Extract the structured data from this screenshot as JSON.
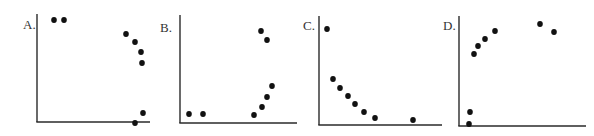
{
  "figure": {
    "width": 594,
    "height": 136,
    "axis_color": "#2a2a2a",
    "dot_color": "#111111",
    "dot_radius": 3
  },
  "chart_data": [
    {
      "type": "scatter",
      "title": "A.",
      "xlabel": "",
      "ylabel": "",
      "grid": false,
      "legend": null,
      "label_pos": {
        "x": 23,
        "y": 18
      },
      "axes": {
        "origin": {
          "x": 37,
          "y": 122
        },
        "y_top": 14,
        "x_right": 150
      },
      "points_px": [
        {
          "x": 54,
          "y": 20
        },
        {
          "x": 64,
          "y": 20
        },
        {
          "x": 126,
          "y": 34
        },
        {
          "x": 135,
          "y": 42
        },
        {
          "x": 141,
          "y": 52
        },
        {
          "x": 142,
          "y": 63
        },
        {
          "x": 143,
          "y": 113
        },
        {
          "x": 135,
          "y": 123
        }
      ],
      "points_normalized": [
        {
          "x": 0.15,
          "y": 0.95
        },
        {
          "x": 0.24,
          "y": 0.95
        },
        {
          "x": 0.79,
          "y": 0.81
        },
        {
          "x": 0.87,
          "y": 0.74
        },
        {
          "x": 0.92,
          "y": 0.65
        },
        {
          "x": 0.93,
          "y": 0.55
        },
        {
          "x": 0.94,
          "y": 0.08
        },
        {
          "x": 0.87,
          "y": 0.0
        }
      ]
    },
    {
      "type": "scatter",
      "title": "B.",
      "xlabel": "",
      "ylabel": "",
      "grid": false,
      "legend": null,
      "label_pos": {
        "x": 160,
        "y": 21
      },
      "axes": {
        "origin": {
          "x": 180,
          "y": 123
        },
        "y_top": 15,
        "x_right": 297
      },
      "points_px": [
        {
          "x": 189,
          "y": 114
        },
        {
          "x": 203,
          "y": 114
        },
        {
          "x": 261,
          "y": 31
        },
        {
          "x": 267,
          "y": 40
        },
        {
          "x": 272,
          "y": 86
        },
        {
          "x": 267,
          "y": 97
        },
        {
          "x": 262,
          "y": 107
        },
        {
          "x": 254,
          "y": 115
        }
      ],
      "points_normalized": [
        {
          "x": 0.08,
          "y": 0.08
        },
        {
          "x": 0.2,
          "y": 0.08
        },
        {
          "x": 0.69,
          "y": 0.85
        },
        {
          "x": 0.74,
          "y": 0.77
        },
        {
          "x": 0.79,
          "y": 0.34
        },
        {
          "x": 0.74,
          "y": 0.24
        },
        {
          "x": 0.7,
          "y": 0.15
        },
        {
          "x": 0.63,
          "y": 0.07
        }
      ]
    },
    {
      "type": "scatter",
      "title": "C.",
      "xlabel": "",
      "ylabel": "",
      "grid": false,
      "legend": null,
      "label_pos": {
        "x": 303,
        "y": 19
      },
      "axes": {
        "origin": {
          "x": 319,
          "y": 125
        },
        "y_top": 16,
        "x_right": 442
      },
      "points_px": [
        {
          "x": 327,
          "y": 29
        },
        {
          "x": 333,
          "y": 79
        },
        {
          "x": 340,
          "y": 88
        },
        {
          "x": 348,
          "y": 96
        },
        {
          "x": 355,
          "y": 104
        },
        {
          "x": 364,
          "y": 112
        },
        {
          "x": 375,
          "y": 118
        },
        {
          "x": 413,
          "y": 120
        }
      ],
      "points_normalized": [
        {
          "x": 0.07,
          "y": 0.88
        },
        {
          "x": 0.11,
          "y": 0.42
        },
        {
          "x": 0.17,
          "y": 0.34
        },
        {
          "x": 0.24,
          "y": 0.27
        },
        {
          "x": 0.29,
          "y": 0.19
        },
        {
          "x": 0.37,
          "y": 0.12
        },
        {
          "x": 0.46,
          "y": 0.06
        },
        {
          "x": 0.76,
          "y": 0.05
        }
      ]
    },
    {
      "type": "scatter",
      "title": "D.",
      "xlabel": "",
      "ylabel": "",
      "grid": false,
      "legend": null,
      "label_pos": {
        "x": 443,
        "y": 19
      },
      "axes": {
        "origin": {
          "x": 459,
          "y": 126
        },
        "y_top": 16,
        "x_right": 586
      },
      "points_px": [
        {
          "x": 474,
          "y": 54
        },
        {
          "x": 478,
          "y": 46
        },
        {
          "x": 485,
          "y": 39
        },
        {
          "x": 495,
          "y": 31
        },
        {
          "x": 540,
          "y": 24
        },
        {
          "x": 554,
          "y": 32
        },
        {
          "x": 470,
          "y": 112
        },
        {
          "x": 469,
          "y": 124
        }
      ],
      "points_normalized": [
        {
          "x": 0.12,
          "y": 0.65
        },
        {
          "x": 0.15,
          "y": 0.73
        },
        {
          "x": 0.2,
          "y": 0.79
        },
        {
          "x": 0.28,
          "y": 0.86
        },
        {
          "x": 0.64,
          "y": 0.93
        },
        {
          "x": 0.75,
          "y": 0.85
        },
        {
          "x": 0.09,
          "y": 0.13
        },
        {
          "x": 0.08,
          "y": 0.02
        }
      ]
    }
  ]
}
